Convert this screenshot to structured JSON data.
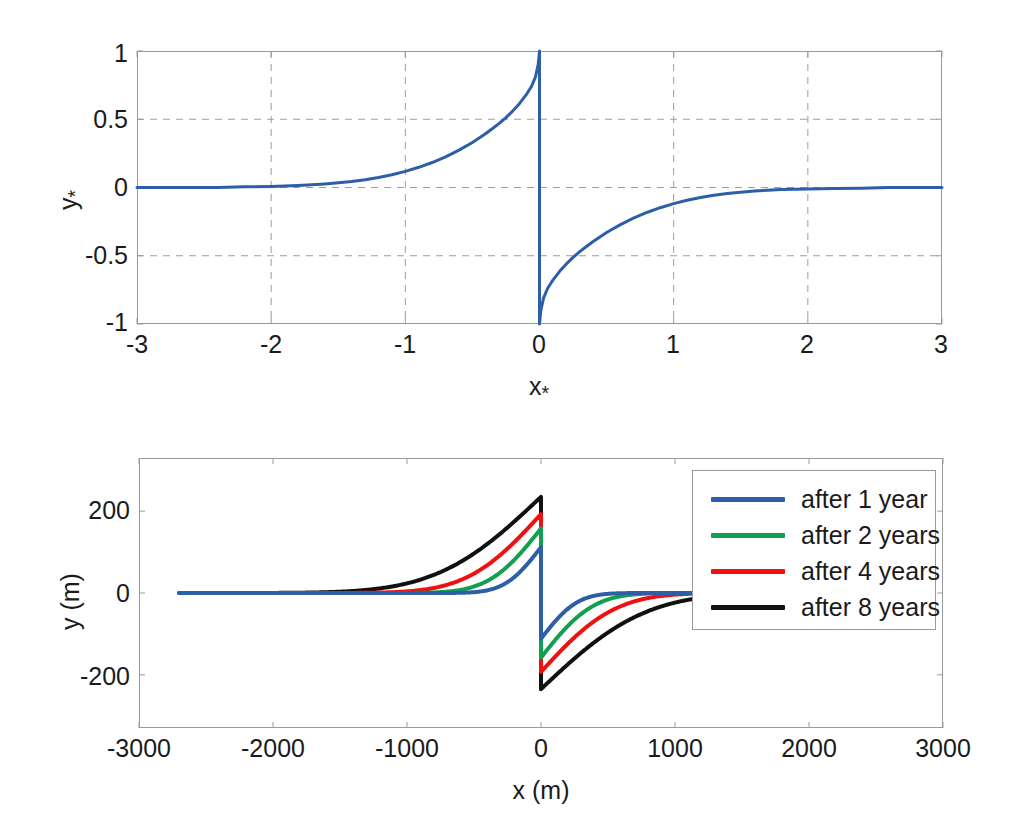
{
  "figure": {
    "background": "#ffffff",
    "panels": [
      "top",
      "bottom"
    ]
  },
  "chart_data": [
    {
      "id": "top",
      "type": "line",
      "title": "",
      "xlabel": "x*",
      "ylabel": "y*",
      "xlabel_base": "x",
      "xlabel_sub": "*",
      "ylabel_base": "y",
      "ylabel_sub": "*",
      "xlim": [
        -3,
        3
      ],
      "ylim": [
        -1,
        1
      ],
      "xticks": [
        -3,
        -2,
        -1,
        0,
        1,
        2,
        3
      ],
      "xticklabels": [
        "-3",
        "-2",
        "-1",
        "0",
        "1",
        "2",
        "3"
      ],
      "yticks": [
        1,
        0.5,
        0,
        -0.5,
        -1
      ],
      "yticklabels": [
        "1",
        "0.5",
        "0",
        "-0.5",
        "-1"
      ],
      "grid": true,
      "grid_style": "dashed",
      "grid_color": "#9d9d9d",
      "legend": false,
      "series": [
        {
          "name": "normalized shoreline",
          "color": "#2C5FA8",
          "width": 3,
          "description": "antisymmetric decaying profile: ~0 at x=-3, rises to +1 at x=0 minus, vertical drop to -1 at x=0 plus, decays to ~0 by x=+3",
          "x": [
            -3.0,
            -2.8,
            -2.6,
            -2.4,
            -2.2,
            -2.0,
            -1.9,
            -1.8,
            -1.7,
            -1.6,
            -1.5,
            -1.4,
            -1.3,
            -1.2,
            -1.1,
            -1.0,
            -0.9,
            -0.8,
            -0.7,
            -0.6,
            -0.5,
            -0.45,
            -0.4,
            -0.35,
            -0.3,
            -0.25,
            -0.2,
            -0.15,
            -0.1,
            -0.06,
            -0.03,
            -0.01,
            0.0,
            0.0,
            0.01,
            0.03,
            0.06,
            0.1,
            0.15,
            0.2,
            0.25,
            0.3,
            0.35,
            0.4,
            0.45,
            0.5,
            0.6,
            0.7,
            0.8,
            0.9,
            1.0,
            1.1,
            1.2,
            1.3,
            1.4,
            1.5,
            1.6,
            1.7,
            1.8,
            2.0,
            2.2,
            2.4,
            2.6,
            2.8,
            3.0
          ],
          "y": [
            0.0,
            0.0,
            0.0,
            0.0,
            0.005,
            0.008,
            0.011,
            0.015,
            0.02,
            0.026,
            0.034,
            0.044,
            0.057,
            0.073,
            0.093,
            0.118,
            0.148,
            0.183,
            0.225,
            0.274,
            0.33,
            0.362,
            0.396,
            0.432,
            0.47,
            0.512,
            0.56,
            0.614,
            0.678,
            0.74,
            0.81,
            0.9,
            1.0,
            -1.0,
            -0.9,
            -0.81,
            -0.74,
            -0.678,
            -0.614,
            -0.56,
            -0.512,
            -0.47,
            -0.432,
            -0.396,
            -0.362,
            -0.33,
            -0.274,
            -0.225,
            -0.183,
            -0.148,
            -0.118,
            -0.093,
            -0.073,
            -0.057,
            -0.044,
            -0.034,
            -0.026,
            -0.02,
            -0.015,
            -0.011,
            -0.008,
            -0.005,
            0.0,
            0.0,
            0.0
          ]
        }
      ]
    },
    {
      "id": "bottom",
      "type": "line",
      "title": "",
      "xlabel": "x (m)",
      "ylabel": "y (m)",
      "xlim": [
        -3000,
        3000
      ],
      "ylim": [
        -330,
        330
      ],
      "xticks": [
        -3000,
        -2000,
        -1000,
        0,
        1000,
        2000,
        3000
      ],
      "xticklabels": [
        "-3000",
        "-2000",
        "-1000",
        "0",
        "1000",
        "2000",
        "3000"
      ],
      "yticks": [
        200,
        0,
        -200
      ],
      "yticklabels": [
        "200",
        "0",
        "-200"
      ],
      "grid": false,
      "legend": true,
      "legend_position": "top-right",
      "series": [
        {
          "name": "after 1 year",
          "color": "#2C5FA8",
          "width": 4,
          "peak": 112,
          "x_extent": [
            -2700,
            1130
          ]
        },
        {
          "name": "after 2 years",
          "color": "#12A050",
          "width": 4,
          "peak": 158,
          "x_extent": [
            -2700,
            1130
          ]
        },
        {
          "name": "after 4 years",
          "color": "#F01010",
          "width": 4,
          "peak": 193,
          "x_extent": [
            -2700,
            1130
          ]
        },
        {
          "name": "after 8 years",
          "color": "#111111",
          "width": 4,
          "peak": 235,
          "x_extent": [
            -2700,
            1130
          ]
        }
      ],
      "shape_profile": {
        "description": "Each series follows y = peak * erfc-like decay, antisymmetric about x=0 with a vertical jump from +peak to -peak at x=0. Decay length scales with sqrt(time).",
        "decay_lengths_m": [
          300,
          430,
          610,
          860
        ]
      }
    }
  ],
  "legend": {
    "entries": [
      {
        "label": "after 1 year",
        "color": "#2C5FA8"
      },
      {
        "label": "after 2 years",
        "color": "#12A050"
      },
      {
        "label": "after 4 years",
        "color": "#F01010"
      },
      {
        "label": "after 8 years",
        "color": "#111111"
      }
    ]
  }
}
